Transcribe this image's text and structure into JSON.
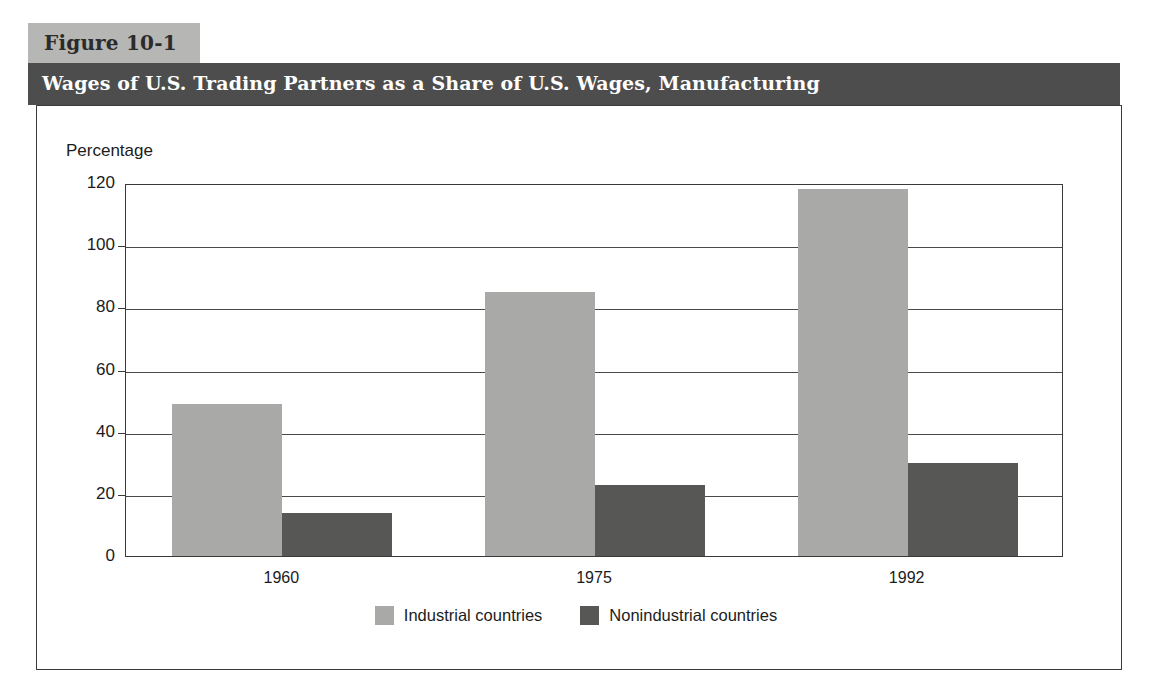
{
  "figure": {
    "number_label": "Figure 10-1",
    "title": "Wages of U.S. Trading Partners as a Share of U.S. Wages, Manufacturing"
  },
  "colors": {
    "title_bar": "#4d4d4d",
    "tab": "#b6b6b4",
    "industrial": "#a9a9a7",
    "nonindustrial": "#575755",
    "frame": "#3a3a3a"
  },
  "chart_data": {
    "type": "bar",
    "title": "Wages of U.S. Trading Partners as a Share of U.S. Wages, Manufacturing",
    "xlabel": "",
    "ylabel": "Percentage",
    "ylim": [
      0,
      120
    ],
    "yticks": [
      0,
      20,
      40,
      60,
      80,
      100,
      120
    ],
    "ytick_labels": [
      "0",
      "20",
      "40",
      "60",
      "80",
      "100",
      "120"
    ],
    "categories": [
      "1960",
      "1975",
      "1992"
    ],
    "grid": true,
    "legend_position": "bottom-center",
    "series": [
      {
        "name": "Industrial countries",
        "color": "#a9a9a7",
        "values": [
          49,
          85,
          118
        ]
      },
      {
        "name": "Nonindustrial countries",
        "color": "#575755",
        "values": [
          14,
          23,
          30
        ]
      }
    ]
  }
}
